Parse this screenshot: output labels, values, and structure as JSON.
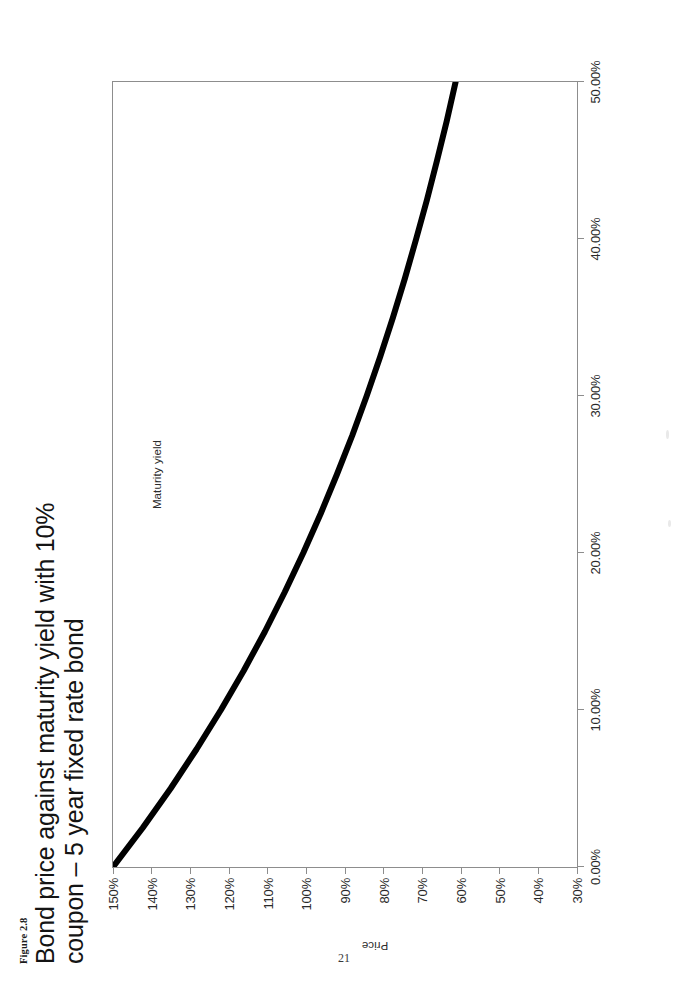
{
  "page": {
    "folio": "21",
    "background_color": "#ffffff",
    "orientation_note_degrees": -90
  },
  "caption": {
    "figure_number": "Figure 2.8",
    "title": "Bond price against maturity yield with 10% coupon – 5 year fixed rate bond"
  },
  "axes": {
    "x_title": "Maturity yield",
    "y_title": "Price",
    "line_color": "#000000",
    "frame_color": "#8d8d8d"
  },
  "chart_data": {
    "type": "line",
    "title": "Bond price against maturity yield with 10% coupon – 5 year fixed rate bond",
    "xlabel": "Maturity yield",
    "ylabel": "Price",
    "xlim": [
      0,
      50
    ],
    "ylim": [
      30,
      150
    ],
    "grid": false,
    "legend": null,
    "x_tick_labels": [
      "0.00%",
      "10.00%",
      "20.00%",
      "30.00%",
      "40.00%",
      "50.00%"
    ],
    "x_tick_values": [
      0,
      10,
      20,
      30,
      40,
      50
    ],
    "y_tick_labels": [
      "30%",
      "40%",
      "50%",
      "60%",
      "70%",
      "80%",
      "90%",
      "100%",
      "110%",
      "120%",
      "130%",
      "140%",
      "150%"
    ],
    "y_tick_values": [
      30,
      40,
      50,
      60,
      70,
      80,
      90,
      100,
      110,
      120,
      130,
      140,
      150
    ],
    "series": [
      {
        "name": "Bond price",
        "x": [
          0,
          2.5,
          5,
          7.5,
          10,
          12.5,
          15,
          17.5,
          20,
          22.5,
          25,
          27.5,
          30,
          32.5,
          35,
          37.5,
          40,
          42.5,
          45,
          47.5,
          50
        ],
        "y": [
          150.0,
          142.3,
          135.1,
          128.4,
          122.1,
          116.2,
          110.7,
          105.6,
          100.8,
          96.3,
          92.1,
          88.1,
          84.4,
          80.9,
          77.6,
          74.5,
          71.6,
          68.8,
          66.2,
          63.7,
          61.4
        ]
      }
    ]
  }
}
